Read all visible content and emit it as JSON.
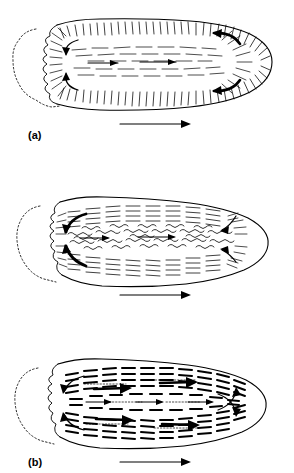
{
  "figure": {
    "type": "diagram",
    "background_color": "#ffffff",
    "ink_color": "#000000",
    "width": 294,
    "height": 473
  },
  "panels": [
    {
      "id": "a",
      "label": "(a)",
      "label_position": {
        "x": 28,
        "y": 130
      },
      "cell": {
        "front_end": "right",
        "rear_end": "left",
        "rear_outline_style": "dotted-crenulated-uroid",
        "body_outline_style": "solid-smooth"
      },
      "texture": {
        "name": "fine-radial-hatching",
        "cortex_marks": "long thin radial lines",
        "core_marks": "short horizontal dashes"
      },
      "flow_arrows": {
        "axial_forward_count": 2,
        "fountain_arrows_front": 2,
        "fountain_arrows_rear": 2,
        "description": "forward axial endoplasm flow with fountain reversal at front and recruitment at rear"
      },
      "direction_arrow": {
        "label": "direction of movement",
        "x1": 120,
        "x2": 190,
        "y": 124,
        "points": "right"
      }
    },
    {
      "id": "b",
      "label": "(b)",
      "label_position": {
        "x": 28,
        "y": 297
      },
      "cell": {
        "front_end": "right",
        "rear_end": "left",
        "rear_outline_style": "dotted-crenulated-uroid",
        "body_outline_style": "solid-smooth"
      },
      "texture": {
        "name": "short-dash-grid-with-wavy-core",
        "cortex_marks": "short horizontal dashes in vertical columns",
        "core_marks": "squiggly wavy filaments"
      },
      "flow_arrows": {
        "axial_forward_count": 2,
        "fountain_arrows_front": 2,
        "fountain_arrows_rear": 2,
        "description": "axial flow of disordered wavy filaments, heavy curved arrows at rear"
      },
      "direction_arrow": {
        "label": "direction of movement",
        "x1": 120,
        "x2": 190,
        "y": 295,
        "points": "right"
      }
    },
    {
      "id": "c",
      "label": "(c)",
      "label_position": {
        "x": 28,
        "y": 455
      },
      "cell": {
        "front_end": "right",
        "rear_end": "left",
        "rear_outline_style": "dotted-crenulated-uroid",
        "body_outline_style": "solid-smooth"
      },
      "texture": {
        "name": "bold-dash-columns",
        "cortex_marks": "thick stubby dashes arranged in vertical columns",
        "core_marks": "thick stubby dashes with fine stipple trails"
      },
      "flow_arrows": {
        "axial_forward_count": 3,
        "heavy_forward_arrows": 4,
        "fountain_arrows_front": 2,
        "fountain_arrows_rear": 2,
        "description": "bold forward arrows through ordered filament bundles with recycling loops at both ends"
      },
      "direction_arrow": {
        "label": "direction of movement",
        "x1": 120,
        "x2": 190,
        "y": 462,
        "points": "right"
      }
    }
  ]
}
